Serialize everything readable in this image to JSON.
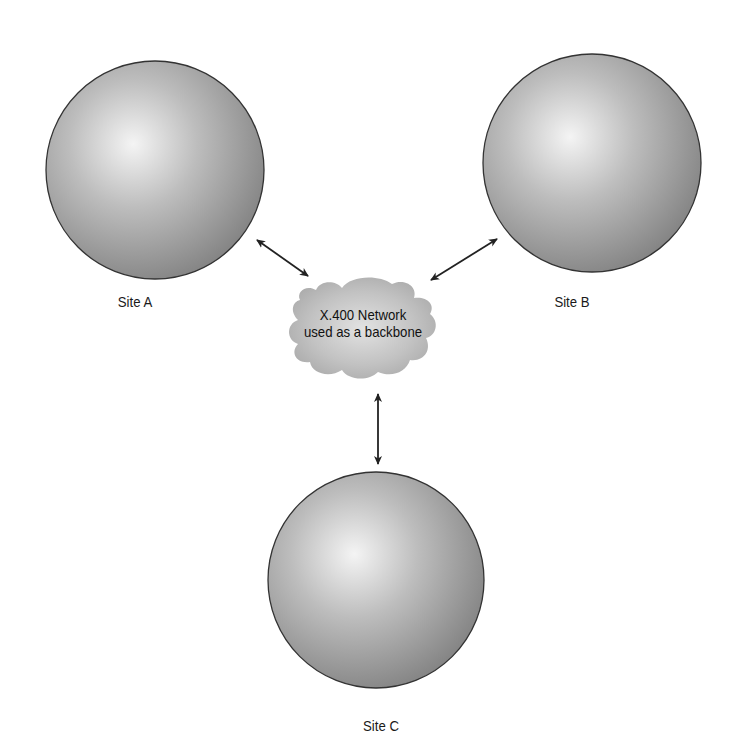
{
  "diagram": {
    "sites": [
      {
        "id": "A",
        "label": "Site A"
      },
      {
        "id": "B",
        "label": "Site B"
      },
      {
        "id": "C",
        "label": "Site C"
      }
    ],
    "backbone": {
      "line1": "X.400 Network",
      "line2": "used as a backbone"
    },
    "connections": [
      {
        "from": "Site A",
        "to": "X.400 Network",
        "type": "bidirectional"
      },
      {
        "from": "Site B",
        "to": "X.400 Network",
        "type": "bidirectional"
      },
      {
        "from": "Site C",
        "to": "X.400 Network",
        "type": "bidirectional"
      }
    ],
    "colors": {
      "sphere_highlight": "#f2f2f2",
      "sphere_shade": "#8a8a8a",
      "sphere_outline": "#333333",
      "cloud": "#b8b8b8",
      "arrow": "#222222"
    }
  }
}
